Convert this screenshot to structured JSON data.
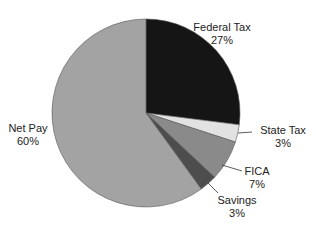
{
  "chart_data": {
    "type": "pie",
    "title": "",
    "start_angle_deg": 0,
    "direction": "clockwise",
    "slices": [
      {
        "label": "Federal Tax",
        "value": 27,
        "display": "27%",
        "color": "#151515"
      },
      {
        "label": "State Tax",
        "value": 3,
        "display": "3%",
        "color": "#e2e2e2"
      },
      {
        "label": "FICA",
        "value": 7,
        "display": "7%",
        "color": "#8a8a8a"
      },
      {
        "label": "Savings",
        "value": 3,
        "display": "3%",
        "color": "#4d4d4d"
      },
      {
        "label": "Net Pay",
        "value": 60,
        "display": "60%",
        "color": "#a3a3a3"
      }
    ]
  },
  "labels": {
    "federal": {
      "name": "Federal Tax",
      "pct": "27%"
    },
    "state": {
      "name": "State Tax",
      "pct": "3%"
    },
    "fica": {
      "name": "FICA",
      "pct": "7%"
    },
    "savings": {
      "name": "Savings",
      "pct": "3%"
    },
    "netpay": {
      "name": "Net Pay",
      "pct": "60%"
    }
  }
}
